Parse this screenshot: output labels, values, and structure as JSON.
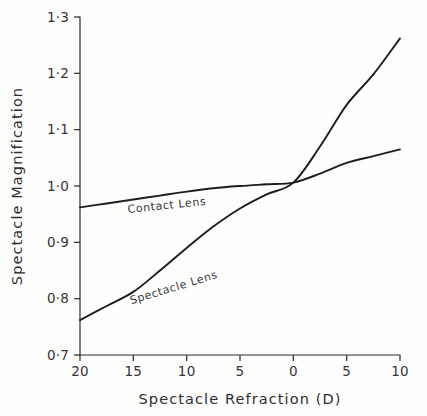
{
  "chart_data": {
    "type": "line",
    "title": "",
    "xlabel": "Spectacle Refraction (D)",
    "ylabel": "Spectacle Magnification",
    "grid": false,
    "legend_position": "inline-curve-labels",
    "xlim": [
      -20,
      10
    ],
    "ylim": [
      0.7,
      1.3
    ],
    "x_tick_values": [
      -20,
      -15,
      -10,
      -5,
      0,
      5,
      10
    ],
    "x_tick_labels": [
      "20",
      "15",
      "10",
      "5",
      "0",
      "5",
      "10"
    ],
    "y_tick_values": [
      0.7,
      0.8,
      0.9,
      1.0,
      1.1,
      1.2,
      1.3
    ],
    "y_tick_labels": [
      "0·7",
      "0·8",
      "0·9",
      "1·0",
      "1·1",
      "1·2",
      "1·3"
    ],
    "x": [
      -20,
      -17.5,
      -15,
      -12.5,
      -10,
      -7.5,
      -5,
      -2.5,
      0,
      2.5,
      5,
      7.5,
      10
    ],
    "series": [
      {
        "name": "Contact Lens",
        "label_x": -15.5,
        "label_y": 0.952,
        "label_rotation": -6,
        "values": [
          0.962,
          0.969,
          0.976,
          0.983,
          0.99,
          0.996,
          1.0,
          1.003,
          1.006,
          1.022,
          1.041,
          1.053,
          1.065
        ]
      },
      {
        "name": "Spectacle Lens",
        "label_x": -15.2,
        "label_y": 0.79,
        "label_rotation": -17,
        "values": [
          0.762,
          0.787,
          0.812,
          0.85,
          0.89,
          0.928,
          0.96,
          0.985,
          1.006,
          1.07,
          1.144,
          1.198,
          1.262
        ]
      }
    ]
  },
  "axis_titles": {
    "x": "Spectacle Refraction (D)",
    "y": "Spectacle Magnification"
  },
  "colors": {
    "background": "#fdfdfc",
    "axis": "#2b2b2b",
    "curve": "#1d1d1d",
    "text": "#35353a"
  }
}
